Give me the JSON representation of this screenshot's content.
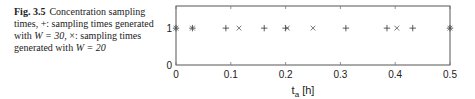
{
  "caption": {
    "figure_label": "Fig. 3.5",
    "text_part1": "Concentration sampling times, +: sampling times generated with ",
    "w1": "W = 30",
    "text_part2": ", ×: sampling times generated with ",
    "w2": "W = 20"
  },
  "chart_data": {
    "type": "scatter",
    "title": "",
    "xlabel": "t_a [h]",
    "ylabel": "",
    "xlim": [
      0,
      0.5
    ],
    "ylim": [
      0,
      1.6
    ],
    "xticks": [
      "0",
      "0.1",
      "0.2",
      "0.3",
      "0.4",
      "0.5"
    ],
    "yticks": [
      "0",
      "1"
    ],
    "grid": false,
    "series": [
      {
        "name": "W = 30",
        "marker": "+",
        "x": [
          0,
          0.03,
          0.091,
          0.161,
          0.2,
          0.31,
          0.385,
          0.432,
          0.5
        ],
        "y": [
          1,
          1,
          1,
          1,
          1,
          1,
          1,
          1,
          1
        ]
      },
      {
        "name": "W = 20",
        "marker": "×",
        "x": [
          0,
          0.03,
          0.115,
          0.203,
          0.25,
          0.403,
          0.5
        ],
        "y": [
          1,
          1,
          1,
          1,
          1,
          1,
          1
        ]
      }
    ]
  }
}
